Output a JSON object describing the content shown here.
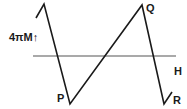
{
  "diagram": {
    "type": "hysteresis-loop",
    "y_axis_label": "4πM↑",
    "x_axis_label": "H",
    "points": {
      "P": "P",
      "Q": "Q",
      "R": "R"
    },
    "colors": {
      "line": "#1a1a1a",
      "axis": "#555555",
      "background": "#ffffff"
    },
    "axis": {
      "y": 56,
      "x_start": 33,
      "x_end": 176
    },
    "path_points": [
      [
        36,
        18
      ],
      [
        44,
        4
      ],
      [
        70,
        104
      ],
      [
        142,
        5
      ],
      [
        164,
        104
      ],
      [
        172,
        92
      ]
    ]
  }
}
